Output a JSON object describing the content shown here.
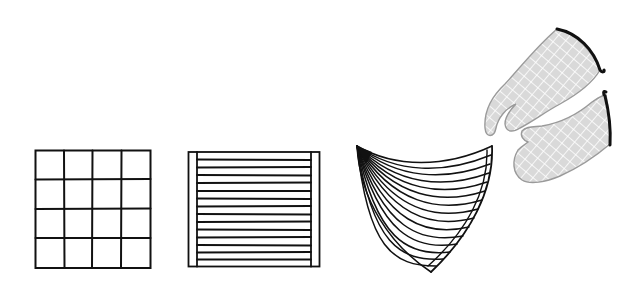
{
  "scene": {
    "description": "Line illustrations of kitchen textiles: a square grid potholder, a striped square potholder, a fan-folded cloth and a pair of quilted oven mitts",
    "background": "#ffffff",
    "ink_color": "#111111"
  },
  "items": [
    {
      "name": "grid-potholder",
      "label": "Grid potholder",
      "kind": "square",
      "rows": 4,
      "cols": 4,
      "bbox": [
        35,
        150,
        150,
        268
      ]
    },
    {
      "name": "striped-potholder",
      "label": "Striped potholder",
      "kind": "square",
      "stripes": 14,
      "bbox": [
        188,
        152,
        319,
        266
      ],
      "inner_border_x": [
        197,
        311
      ]
    },
    {
      "name": "fan-cloth",
      "label": "Fan-folded cloth",
      "kind": "fan",
      "folds": 16,
      "apex": [
        357,
        146
      ],
      "top_right": [
        492,
        146
      ],
      "bottom_tip": [
        431,
        272
      ]
    },
    {
      "name": "oven-mitt-upper",
      "label": "Oven mitt",
      "kind": "mitt",
      "fill": "#d9d9d9",
      "quilt_line": "#ffffff",
      "outline": "#9a9a9a",
      "cuff": "#111111"
    },
    {
      "name": "oven-mitt-lower",
      "label": "Oven mitt",
      "kind": "mitt",
      "fill": "#d9d9d9",
      "quilt_line": "#ffffff",
      "outline": "#9a9a9a",
      "cuff": "#111111"
    }
  ]
}
